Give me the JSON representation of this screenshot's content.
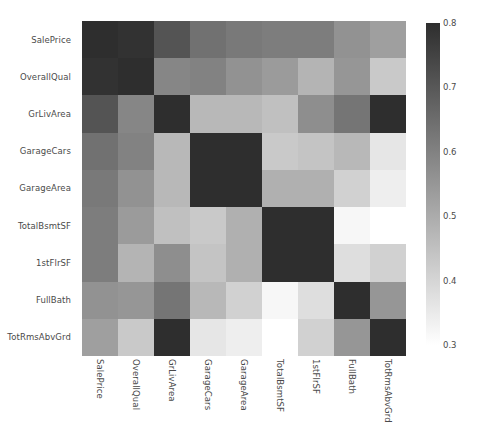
{
  "chart_data": {
    "type": "heatmap",
    "title": "",
    "xlabel": "",
    "ylabel": "",
    "grid": false,
    "legend_position": "right",
    "colormap": "gray_r",
    "vmin": 0.3,
    "vmax": 0.8,
    "colorbar": {
      "ticks": [
        "0.8",
        "0.7",
        "0.6",
        "0.5",
        "0.4",
        "0.3"
      ],
      "tick_values": [
        0.8,
        0.7,
        0.6,
        0.5,
        0.4,
        0.3
      ],
      "orientation": "vertical",
      "min_label": "0.3",
      "max_label": "0.8"
    },
    "categories": [
      "SalePrice",
      "OverallQual",
      "GrLivArea",
      "GarageCars",
      "GarageArea",
      "TotalBsmtSF",
      "1stFlrSF",
      "FullBath",
      "TotRmsAbvGrd"
    ],
    "xticklabels": [
      "SalePrice",
      "OverallQual",
      "GrLivArea",
      "GarageCars",
      "GarageArea",
      "TotalBsmtSF",
      "1stFlrSF",
      "FullBath",
      "TotRmsAbvGrd"
    ],
    "yticklabels": [
      "SalePrice",
      "OverallQual",
      "GrLivArea",
      "GarageCars",
      "GarageArea",
      "TotalBsmtSF",
      "1stFlrSF",
      "FullBath",
      "TotRmsAbvGrd"
    ],
    "matrix": [
      [
        1.0,
        0.79,
        0.71,
        0.64,
        0.62,
        0.61,
        0.61,
        0.56,
        0.53
      ],
      [
        0.79,
        1.0,
        0.59,
        0.6,
        0.56,
        0.54,
        0.48,
        0.55,
        0.43
      ],
      [
        0.71,
        0.59,
        1.0,
        0.47,
        0.47,
        0.45,
        0.57,
        0.63,
        0.83
      ],
      [
        0.64,
        0.6,
        0.47,
        1.0,
        0.88,
        0.43,
        0.44,
        0.47,
        0.36
      ],
      [
        0.62,
        0.56,
        0.47,
        0.88,
        1.0,
        0.49,
        0.49,
        0.41,
        0.34
      ],
      [
        0.61,
        0.54,
        0.45,
        0.43,
        0.49,
        1.0,
        0.82,
        0.32,
        0.29
      ],
      [
        0.61,
        0.48,
        0.57,
        0.44,
        0.49,
        0.82,
        1.0,
        0.38,
        0.41
      ],
      [
        0.56,
        0.55,
        0.63,
        0.47,
        0.41,
        0.32,
        0.38,
        1.0,
        0.55
      ],
      [
        0.53,
        0.43,
        0.83,
        0.36,
        0.34,
        0.29,
        0.41,
        0.55,
        1.0
      ]
    ]
  }
}
